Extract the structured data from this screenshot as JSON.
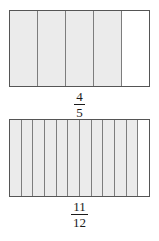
{
  "page": {
    "background_color": "#ffffff"
  },
  "style": {
    "shaded_color": "#ebebeb",
    "unshaded_color": "#ffffff",
    "divider_color": "#7d7d7d",
    "border_color": "#555555",
    "text_color": "#1a1a1a"
  },
  "figures": [
    {
      "id": "fraction-bar-4-5",
      "total_parts": 5,
      "shaded_parts": 4,
      "cells": [
        {
          "shaded": true
        },
        {
          "shaded": true
        },
        {
          "shaded": true
        },
        {
          "shaded": true
        },
        {
          "shaded": false
        }
      ],
      "label": {
        "numerator": "4",
        "denominator": "5",
        "text": "4/5"
      }
    },
    {
      "id": "fraction-bar-11-12",
      "total_parts": 12,
      "shaded_parts": 11,
      "cells": [
        {
          "shaded": true
        },
        {
          "shaded": true
        },
        {
          "shaded": true
        },
        {
          "shaded": true
        },
        {
          "shaded": true
        },
        {
          "shaded": true
        },
        {
          "shaded": true
        },
        {
          "shaded": true
        },
        {
          "shaded": true
        },
        {
          "shaded": true
        },
        {
          "shaded": true
        },
        {
          "shaded": false
        }
      ],
      "label": {
        "numerator": "11",
        "denominator": "12",
        "text": "11/12"
      }
    }
  ]
}
